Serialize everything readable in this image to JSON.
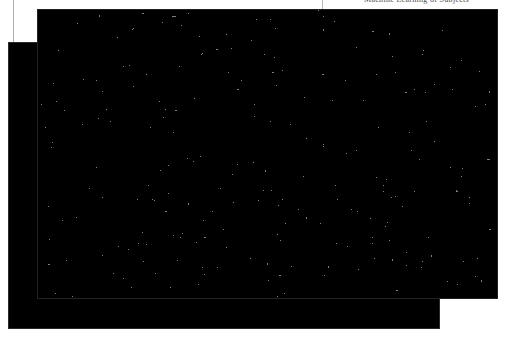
{
  "page": {
    "width": 509,
    "height": 338,
    "background": "#ffffff",
    "document_type": "scanned-page"
  },
  "header": {
    "running_text": "Machine Learning of Subjects",
    "clipped": true,
    "rule_color": "#b9b9b9"
  },
  "margin": {
    "rule_color": "#b0b0b0"
  },
  "figures": [
    {
      "id": "panel-back",
      "name": "back-figure",
      "x": 8,
      "y": 42,
      "width": 432,
      "height": 287,
      "z": 1,
      "texture": "dithered-noise",
      "density": "dark",
      "ink_color": "#000000",
      "paper_color": "#ffffff",
      "border_color": "#2a2a2a"
    },
    {
      "id": "panel-front",
      "name": "front-figure",
      "x": 37,
      "y": 9,
      "width": 461,
      "height": 290,
      "z": 2,
      "texture": "dithered-noise",
      "density": "medium",
      "ink_color": "#000000",
      "paper_color": "#ffffff",
      "border_color": "#222222"
    }
  ],
  "colors": {
    "ink": "#000000",
    "paper": "#ffffff",
    "rule": "#b0b0b0"
  }
}
